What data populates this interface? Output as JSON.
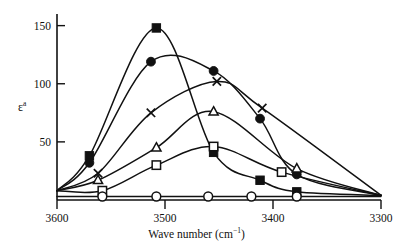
{
  "chart_data": {
    "type": "line",
    "title": "",
    "xlabel": "Wave number (cm⁻¹)",
    "ylabel": "εᵃ",
    "xlim": [
      3600,
      3300
    ],
    "ylim": [
      0,
      160
    ],
    "x_reversed": true,
    "grid": false,
    "legend": "none",
    "xticks": [
      3600,
      3500,
      3400,
      3300
    ],
    "xtick_labels": [
      "3600",
      "3500",
      "3400",
      "3300"
    ],
    "yticks": [
      50,
      100,
      150
    ],
    "ytick_labels": [
      "50",
      "100",
      "150"
    ],
    "series": [
      {
        "name": "filled-square",
        "marker": "filled-square",
        "x": [
          3570,
          3508,
          3455,
          3412,
          3378
        ],
        "values": [
          38,
          148,
          41,
          17,
          7
        ]
      },
      {
        "name": "filled-circle",
        "marker": "filled-circle",
        "x": [
          3570,
          3513,
          3455,
          3412,
          3378
        ],
        "values": [
          32,
          119,
          111,
          70,
          22
        ]
      },
      {
        "name": "cross",
        "marker": "cross",
        "x": [
          3562,
          3513,
          3452,
          3410
        ],
        "values": [
          23,
          75,
          102,
          79
        ]
      },
      {
        "name": "open-triangle",
        "marker": "open-triangle",
        "x": [
          3562,
          3508,
          3455,
          3378
        ],
        "values": [
          17,
          45,
          76,
          27
        ]
      },
      {
        "name": "open-square",
        "marker": "open-square",
        "x": [
          3558,
          3508,
          3455,
          3392
        ],
        "values": [
          8,
          30,
          46,
          24
        ]
      },
      {
        "name": "open-circle",
        "marker": "open-circle",
        "x": [
          3558,
          3508,
          3460,
          3420,
          3378
        ],
        "values": [
          3,
          3,
          3,
          3,
          3
        ]
      }
    ]
  }
}
